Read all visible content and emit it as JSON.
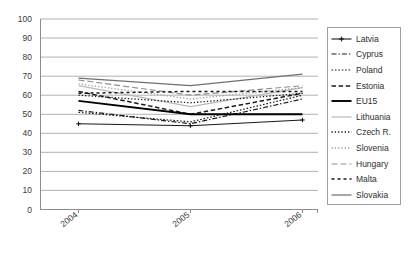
{
  "chart_data": {
    "type": "line",
    "title": "",
    "xlabel": "",
    "ylabel": "",
    "categories": [
      "2004",
      "2005",
      "2006"
    ],
    "x_tick_labels": [
      "2004",
      "2005",
      "2006"
    ],
    "y_tick_labels": [
      "0",
      "10",
      "20",
      "30",
      "40",
      "50",
      "60",
      "70",
      "80",
      "90",
      "100"
    ],
    "ylim": [
      0,
      100
    ],
    "y_tick_step": 10,
    "grid": "horizontal",
    "legend_position": "right-outside",
    "series": [
      {
        "name": "Latvia",
        "values": [
          45,
          44,
          47
        ],
        "style": "solid-marker",
        "color": "#1a1a1a",
        "width": 1.1,
        "marker": "plus"
      },
      {
        "name": "Cyprus",
        "values": [
          52,
          45,
          58
        ],
        "style": "dash-dot",
        "color": "#1a1a1a",
        "width": 1.2
      },
      {
        "name": "Poland",
        "values": [
          51,
          46,
          60
        ],
        "style": "dotted",
        "color": "#1a1a1a",
        "width": 1.2
      },
      {
        "name": "Estonia",
        "values": [
          62,
          50,
          61
        ],
        "style": "dashed",
        "color": "#1a1a1a",
        "width": 1.5
      },
      {
        "name": "EU15",
        "values": [
          57,
          50,
          50
        ],
        "style": "solid",
        "color": "#000000",
        "width": 1.9
      },
      {
        "name": "Lithuania",
        "values": [
          65,
          54,
          64
        ],
        "style": "solid",
        "color": "#b9b9b9",
        "width": 1.2
      },
      {
        "name": "Czech R.",
        "values": [
          60,
          56,
          61
        ],
        "style": "fine-dotted",
        "color": "#1a1a1a",
        "width": 1.3
      },
      {
        "name": "Slovenia",
        "values": [
          66,
          58,
          64
        ],
        "style": "fine-dotted",
        "color": "#9e9e9e",
        "width": 1.3
      },
      {
        "name": "Hungary",
        "values": [
          68,
          60,
          65
        ],
        "style": "long-dash",
        "color": "#8f8f8f",
        "width": 1.2
      },
      {
        "name": "Malta",
        "values": [
          61,
          62,
          62
        ],
        "style": "square-dash",
        "color": "#1a1a1a",
        "width": 1.5
      },
      {
        "name": "Slovakia",
        "values": [
          69,
          65,
          71
        ],
        "style": "solid",
        "color": "#6f6f6f",
        "width": 1.2
      }
    ]
  },
  "legend": {
    "items": [
      {
        "label": "Latvia"
      },
      {
        "label": "Cyprus"
      },
      {
        "label": "Poland"
      },
      {
        "label": "Estonia"
      },
      {
        "label": "EU15"
      },
      {
        "label": "Lithuania"
      },
      {
        "label": "Czech R."
      },
      {
        "label": "Slovenia"
      },
      {
        "label": "Hungary"
      },
      {
        "label": "Malta"
      },
      {
        "label": "Slovakia"
      }
    ]
  },
  "axes": {
    "y_ticks": [
      "100",
      "90",
      "80",
      "70",
      "60",
      "50",
      "40",
      "30",
      "20",
      "10",
      "0"
    ],
    "x_ticks": [
      "2004",
      "2005",
      "2006"
    ]
  },
  "colors": {
    "axis": "#8c8c8c",
    "grid": "#a8a8a8",
    "text": "#3a3a3a",
    "legend_border": "#9aa0a6",
    "background": "#ffffff"
  }
}
